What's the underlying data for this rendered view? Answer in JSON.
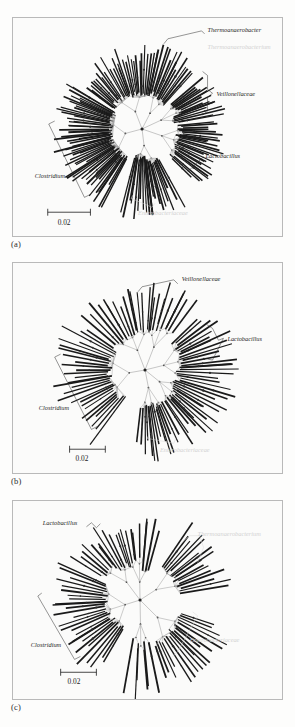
{
  "figure": {
    "type": "phylogenetic-tree-figure",
    "panel_count": 3,
    "background_color": "#fdfdfc",
    "panel_border_color": "#b9b9b9",
    "branch_color": "#1a1a1a",
    "internal_branch_color": "#a9a9a9",
    "faded_label_color": "#d2d2d2"
  },
  "panels": [
    {
      "id": "a",
      "caption": "(a)",
      "scale_bar": {
        "label": "0.02",
        "value": 0.02
      },
      "labels": [
        {
          "name": "thermoanaerobacter",
          "text": "Thermoanaerobacter",
          "style": "dark",
          "marker": "bracket"
        },
        {
          "name": "thermoanaerobacterium",
          "text": "Thermoanaerobacterium",
          "style": "faded",
          "marker": "none"
        },
        {
          "name": "veillonellaceae",
          "text": "Veillonellaceae",
          "style": "dark",
          "marker": "bracket"
        },
        {
          "name": "lactobacillus",
          "text": "Lactobacillus",
          "style": "dark",
          "marker": "leader"
        },
        {
          "name": "clostridium",
          "text": "Clostridium",
          "style": "dark",
          "marker": "bracket"
        },
        {
          "name": "enterobacteriaceae",
          "text": "Enterobacteriaceae",
          "style": "faded",
          "marker": "bracket"
        }
      ]
    },
    {
      "id": "b",
      "caption": "(b)",
      "scale_bar": {
        "label": "0.02",
        "value": 0.02
      },
      "labels": [
        {
          "name": "veillonellaceae",
          "text": "Veillonellaceae",
          "style": "dark",
          "marker": "bracket"
        },
        {
          "name": "lactobacillus",
          "text": "Lactobacillus",
          "style": "dark",
          "marker": "bracket"
        },
        {
          "name": "clostridium",
          "text": "Clostridium",
          "style": "dark",
          "marker": "bracket"
        },
        {
          "name": "enterobacteriaceae",
          "text": "Enterobacteriaceae",
          "style": "faded",
          "marker": "bracket"
        }
      ]
    },
    {
      "id": "c",
      "caption": "(c)",
      "scale_bar": {
        "label": "0.02",
        "value": 0.02
      },
      "labels": [
        {
          "name": "lactobacillus",
          "text": "Lactobacillus",
          "style": "dark",
          "marker": "bracket"
        },
        {
          "name": "thermoanaerobacterium",
          "text": "Thermoanaerobacterium",
          "style": "faded",
          "marker": "bracket"
        },
        {
          "name": "clostridium",
          "text": "Clostridium",
          "style": "dark",
          "marker": "bracket"
        },
        {
          "name": "enterobacteriaceae",
          "text": "Enterobacteriaceae",
          "style": "faded",
          "marker": "bracket"
        }
      ]
    }
  ],
  "chart_data": {
    "type": "scatter",
    "title": "",
    "xlabel": "",
    "ylabel": "",
    "panels": [
      {
        "id": "a",
        "center": [
          130,
          112
        ],
        "tip_count": 168,
        "clades": [
          {
            "name": "Thermoanaerobacter",
            "angle_start": -78,
            "angle_end": -48,
            "tips": 14,
            "radius_min": 52,
            "radius_max": 88
          },
          {
            "name": "Veillonellaceae",
            "angle_start": -40,
            "angle_end": -10,
            "tips": 18,
            "radius_min": 50,
            "radius_max": 86
          },
          {
            "name": "Lactobacillus",
            "angle_start": -6,
            "angle_end": 44,
            "tips": 26,
            "radius_min": 48,
            "radius_max": 88
          },
          {
            "name": "Enterobacteriaceae",
            "angle_start": 62,
            "angle_end": 104,
            "tips": 22,
            "radius_min": 40,
            "radius_max": 92
          },
          {
            "name": "Clostridium",
            "angle_start": 118,
            "angle_end": 212,
            "tips": 58,
            "radius_min": 40,
            "radius_max": 92
          },
          {
            "name": "Unlabeled-upper-left",
            "angle_start": 216,
            "angle_end": 282,
            "tips": 30,
            "radius_min": 45,
            "radius_max": 86
          }
        ]
      },
      {
        "id": "b",
        "center": [
          133,
          108
        ],
        "tip_count": 96,
        "clades": [
          {
            "name": "Veillonellaceae",
            "angle_start": -84,
            "angle_end": -54,
            "tips": 10,
            "radius_min": 55,
            "radius_max": 92
          },
          {
            "name": "Lactobacillus",
            "angle_start": -44,
            "angle_end": 16,
            "tips": 20,
            "radius_min": 50,
            "radius_max": 95
          },
          {
            "name": "Unlabeled-right",
            "angle_start": 20,
            "angle_end": 58,
            "tips": 14,
            "radius_min": 48,
            "radius_max": 92
          },
          {
            "name": "Enterobacteriaceae",
            "angle_start": 62,
            "angle_end": 96,
            "tips": 14,
            "radius_min": 45,
            "radius_max": 95
          },
          {
            "name": "Clostridium",
            "angle_start": 126,
            "angle_end": 214,
            "tips": 28,
            "radius_min": 45,
            "radius_max": 95
          },
          {
            "name": "Unlabeled-upper-left",
            "angle_start": 220,
            "angle_end": 278,
            "tips": 16,
            "radius_min": 50,
            "radius_max": 90
          }
        ]
      },
      {
        "id": "c",
        "center": [
          128,
          100
        ],
        "tip_count": 88,
        "clades": [
          {
            "name": "Lactobacillus",
            "angle_start": -108,
            "angle_end": -74,
            "tips": 10,
            "radius_min": 48,
            "radius_max": 85
          },
          {
            "name": "Thermoanaerobacterium",
            "angle_start": -56,
            "angle_end": -10,
            "tips": 16,
            "radius_min": 50,
            "radius_max": 95
          },
          {
            "name": "Enterobacteriaceae",
            "angle_start": 18,
            "angle_end": 72,
            "tips": 18,
            "radius_min": 55,
            "radius_max": 100
          },
          {
            "name": "Unlabeled-lower",
            "angle_start": 78,
            "angle_end": 100,
            "tips": 6,
            "radius_min": 60,
            "radius_max": 105
          },
          {
            "name": "Clostridium",
            "angle_start": 120,
            "angle_end": 205,
            "tips": 26,
            "radius_min": 45,
            "radius_max": 92
          },
          {
            "name": "Unlabeled-upper",
            "angle_start": 212,
            "angle_end": 254,
            "tips": 12,
            "radius_min": 50,
            "radius_max": 88
          }
        ]
      }
    ]
  }
}
